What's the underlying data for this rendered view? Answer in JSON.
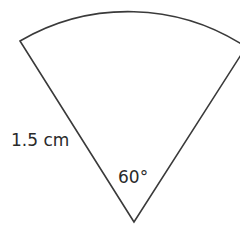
{
  "diagram": {
    "shape": "sector",
    "radius_label": "1.5 cm",
    "angle_label": "60°",
    "stroke_color": "#3a3a3a",
    "background": "#ffffff"
  }
}
